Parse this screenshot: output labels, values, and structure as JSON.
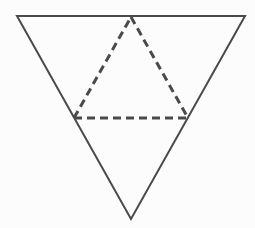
{
  "figure": {
    "name": "inscribed-triangle-diagram",
    "canvas": {
      "width": 255,
      "height": 228
    },
    "background_color": "#fcfcfc",
    "stroke_color": "#4a4a4a",
    "outer_triangle": {
      "name": "outer-triangle",
      "orientation": "point-down",
      "stroke_style": "solid",
      "stroke_width": 2,
      "fill": "none",
      "points": "17,16 245,16 131,219",
      "vertices": [
        {
          "label": "top-left",
          "x": 17,
          "y": 16
        },
        {
          "label": "top-right",
          "x": 245,
          "y": 16
        },
        {
          "label": "bottom-apex",
          "x": 131,
          "y": 219
        }
      ]
    },
    "inner_triangle": {
      "name": "inner-dashed-triangle",
      "orientation": "point-up",
      "stroke_style": "dashed",
      "stroke_width": 3,
      "dash_pattern": "8 5",
      "fill": "none",
      "points": "131,17 188,118 74,118",
      "vertices": [
        {
          "label": "top-apex",
          "x": 131,
          "y": 17
        },
        {
          "label": "bottom-right",
          "x": 188,
          "y": 118
        },
        {
          "label": "bottom-left",
          "x": 74,
          "y": 118
        }
      ],
      "edges": [
        {
          "name": "left-diagonal",
          "x1": 74,
          "y1": 118,
          "x2": 131,
          "y2": 17
        },
        {
          "name": "right-diagonal",
          "x1": 131,
          "y1": 17,
          "x2": 188,
          "y2": 118
        },
        {
          "name": "base-midsegment",
          "x1": 74,
          "y1": 118,
          "x2": 188,
          "y2": 118
        }
      ]
    }
  }
}
